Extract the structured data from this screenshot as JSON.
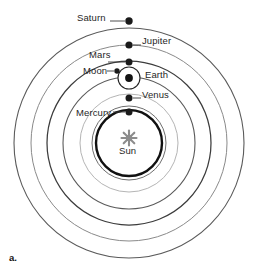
{
  "figure": {
    "caption": "a.",
    "title": "",
    "type": "concentric-orbit-diagram",
    "center": {
      "x": 129,
      "y": 143
    },
    "background_color": "#ffffff",
    "line_color": "#555555",
    "emphasis_color": "#111111",
    "sun_color": "#8c8c8c"
  },
  "orbits": [
    {
      "name": "saturn-orbit",
      "radius": 115,
      "stroke": "#5a5a5a",
      "width": 1.1
    },
    {
      "name": "jupiter-orbit",
      "radius": 98,
      "stroke": "#8a8a8a",
      "width": 1.0
    },
    {
      "name": "mars-orbit",
      "radius": 82,
      "stroke": "#3c3c3c",
      "width": 1.2
    },
    {
      "name": "earth-orbit",
      "radius": 66,
      "stroke": "#5a5a5a",
      "width": 1.1
    },
    {
      "name": "venus-orbit",
      "radius": 49,
      "stroke": "#b0b0b0",
      "width": 1.0
    },
    {
      "name": "mercury-orbit",
      "radius": 37,
      "stroke": "#6e6e6e",
      "width": 1.0
    },
    {
      "name": "sun-sphere",
      "radius": 33,
      "stroke": "#111111",
      "width": 2.4
    }
  ],
  "bodies": [
    {
      "name": "saturn",
      "label": "Saturn",
      "x": 129,
      "y": 21,
      "r": 3.6
    },
    {
      "name": "jupiter",
      "label": "Jupiter",
      "x": 129,
      "y": 45,
      "r": 3.6
    },
    {
      "name": "mars",
      "label": "Mars",
      "x": 129,
      "y": 62,
      "r": 3.4
    },
    {
      "name": "earth",
      "label": "Earth",
      "x": 129,
      "y": 78,
      "r": 3.8
    },
    {
      "name": "moon",
      "label": "Moon",
      "x": 117,
      "y": 71,
      "r": 2.6
    },
    {
      "name": "venus",
      "label": "Venus",
      "x": 129,
      "y": 98,
      "r": 3.4
    },
    {
      "name": "mercury",
      "label": "Mercury",
      "x": 129,
      "y": 112,
      "r": 3.4
    },
    {
      "name": "sun",
      "label": "Sun",
      "x": 129,
      "y": 138,
      "r": 0
    }
  ],
  "epicycle": {
    "name": "moon-epicycle",
    "cx": 129,
    "cy": 78,
    "r": 11,
    "stroke": "#222222",
    "width": 1.1
  },
  "labels": {
    "saturn": "Saturn",
    "jupiter": "Jupiter",
    "mars": "Mars",
    "moon": "Moon",
    "earth": "Earth",
    "venus": "Venus",
    "mercury": "Mercury",
    "sun": "Sun",
    "caption": "a."
  },
  "leader_lines": [
    {
      "name": "saturn-leader",
      "x1": 110,
      "y1": 21,
      "x2": 125,
      "y2": 21
    },
    {
      "name": "mars-leader",
      "x1": 108,
      "y1": 62,
      "x2": 125,
      "y2": 62
    },
    {
      "name": "moon-leader",
      "x1": 106,
      "y1": 71,
      "x2": 114,
      "y2": 71
    },
    {
      "name": "mercury-leader",
      "x1": 112,
      "y1": 112,
      "x2": 125,
      "y2": 112
    },
    {
      "name": "jupiter-leader",
      "x1": 133,
      "y1": 45,
      "x2": 140,
      "y2": 45
    },
    {
      "name": "venus-leader",
      "x1": 133,
      "y1": 98,
      "x2": 140,
      "y2": 98
    }
  ]
}
